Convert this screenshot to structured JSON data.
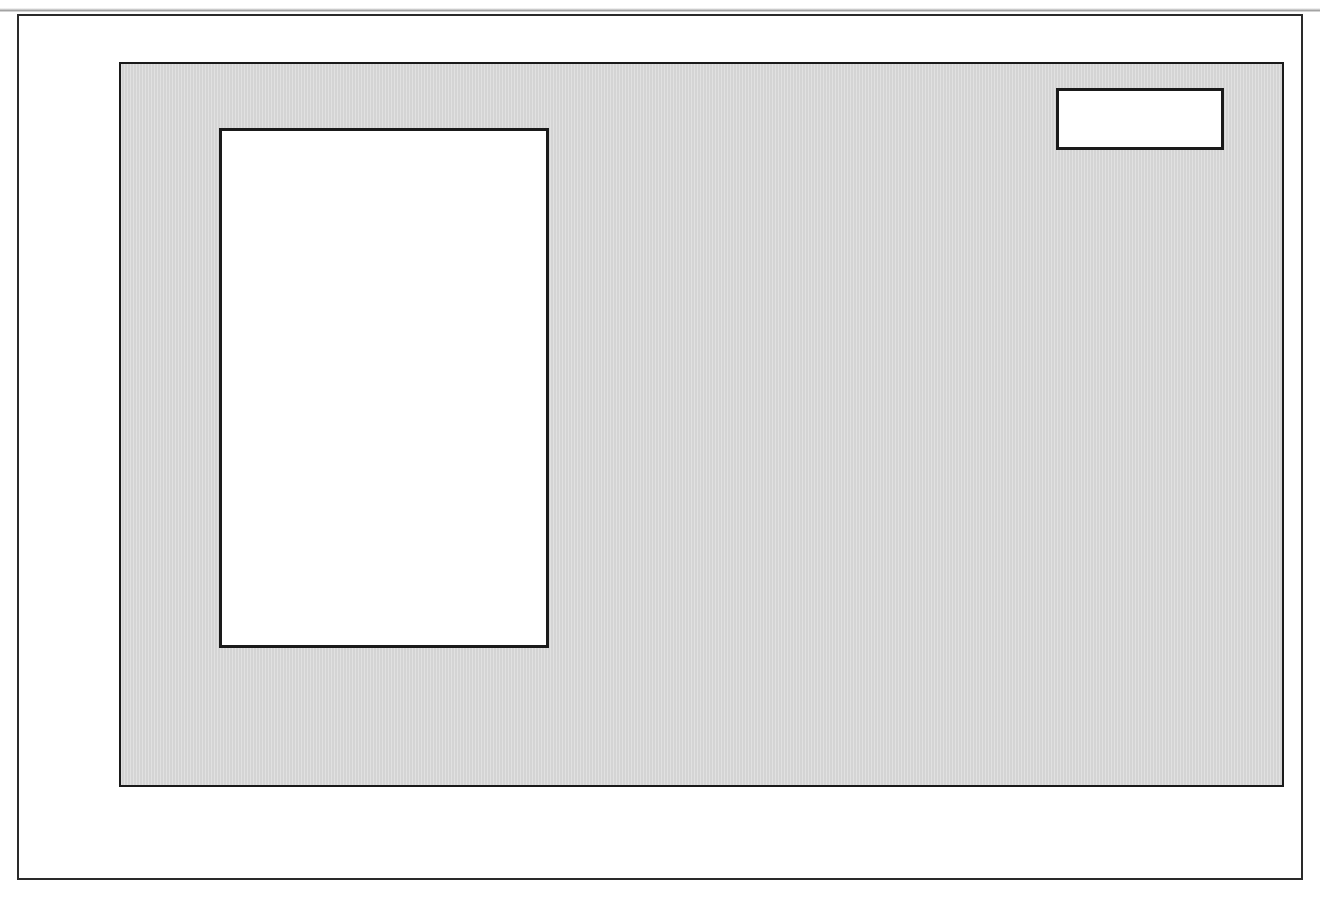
{
  "figure": {
    "scan_artifact_text": "",
    "marker_label": "2010",
    "marker_line_color": "#e8492e",
    "plot_background": "#d4d4d4"
  },
  "axes": {
    "y_title": "Production Gb/a",
    "y_ticks": [
      "1.6",
      "1.2",
      "0.8",
      "0.4",
      "0.0"
    ],
    "x_ticks": [
      "1930",
      "1950",
      "1970",
      "1990",
      "2010",
      "2030"
    ]
  },
  "legend": {
    "items": [
      {
        "label": "Papua-N G",
        "color": "#241a4a"
      },
      {
        "label": "Pakistan",
        "color": "#59608e"
      },
      {
        "label": "Thailand",
        "color": "#d8211a"
      },
      {
        "label": "Brunei",
        "color": "#dde24f"
      },
      {
        "label": "Vietnam",
        "color": "#ffffff"
      },
      {
        "label": "Australia",
        "color": "#cfe3dc"
      },
      {
        "label": "India",
        "color": "#adbacf"
      },
      {
        "label": "Malaysia",
        "color": "#f4a43a"
      },
      {
        "label": "Indonesia",
        "color": "#cfe3c9"
      }
    ]
  },
  "chart_data": {
    "type": "area",
    "stacked": true,
    "title": "",
    "xlabel": "",
    "ylabel": "Production Gb/a",
    "xlim": [
      1930,
      2030
    ],
    "ylim": [
      0.0,
      1.6
    ],
    "y_ticks": [
      0.0,
      0.4,
      0.8,
      1.2,
      1.6
    ],
    "x_ticks": [
      1930,
      1950,
      1970,
      1990,
      2010,
      2030
    ],
    "x_minor_tick_step": 10,
    "grid": "horizontal",
    "legend_position": "upper-left-inside",
    "annotations": [
      {
        "text": "2010",
        "x": 2010,
        "type": "vertical-line-with-box",
        "color": "#e8492e"
      }
    ],
    "x": [
      1930,
      1931,
      1932,
      1933,
      1934,
      1935,
      1936,
      1937,
      1938,
      1939,
      1940,
      1941,
      1942,
      1943,
      1944,
      1945,
      1946,
      1947,
      1948,
      1949,
      1950,
      1951,
      1952,
      1953,
      1954,
      1955,
      1956,
      1957,
      1958,
      1959,
      1960,
      1961,
      1962,
      1963,
      1964,
      1965,
      1966,
      1967,
      1968,
      1969,
      1970,
      1971,
      1972,
      1973,
      1974,
      1975,
      1976,
      1977,
      1978,
      1979,
      1980,
      1981,
      1982,
      1983,
      1984,
      1985,
      1986,
      1987,
      1988,
      1989,
      1990,
      1991,
      1992,
      1993,
      1994,
      1995,
      1996,
      1997,
      1998,
      1999,
      2000,
      2001,
      2002,
      2003,
      2004,
      2005,
      2006,
      2007,
      2008,
      2009,
      2010,
      2011,
      2012,
      2013,
      2014,
      2015,
      2016,
      2017,
      2018,
      2019,
      2020,
      2021,
      2022,
      2023,
      2024,
      2025,
      2026,
      2027,
      2028,
      2029,
      2030
    ],
    "series": [
      {
        "name": "Indonesia",
        "color": "#cfe3c9",
        "values": [
          0.045,
          0.047,
          0.048,
          0.05,
          0.053,
          0.056,
          0.06,
          0.064,
          0.068,
          0.072,
          0.07,
          0.06,
          0.028,
          0.038,
          0.04,
          0.01,
          0.004,
          0.02,
          0.045,
          0.065,
          0.075,
          0.082,
          0.088,
          0.094,
          0.1,
          0.106,
          0.112,
          0.116,
          0.12,
          0.126,
          0.132,
          0.138,
          0.142,
          0.146,
          0.152,
          0.158,
          0.166,
          0.176,
          0.19,
          0.205,
          0.225,
          0.25,
          0.285,
          0.33,
          0.345,
          0.335,
          0.36,
          0.385,
          0.4,
          0.425,
          0.425,
          0.42,
          0.41,
          0.43,
          0.465,
          0.47,
          0.47,
          0.47,
          0.47,
          0.48,
          0.5,
          0.52,
          0.52,
          0.52,
          0.525,
          0.53,
          0.54,
          0.545,
          0.525,
          0.52,
          0.51,
          0.495,
          0.475,
          0.455,
          0.435,
          0.42,
          0.405,
          0.395,
          0.385,
          0.375,
          0.365,
          0.355,
          0.345,
          0.335,
          0.325,
          0.315,
          0.305,
          0.292,
          0.28,
          0.27,
          0.258,
          0.248,
          0.238,
          0.228,
          0.218,
          0.208,
          0.2,
          0.192,
          0.183,
          0.175,
          0.168
        ]
      },
      {
        "name": "Malaysia",
        "color": "#f4a43a",
        "values": [
          0,
          0,
          0,
          0,
          0,
          0,
          0,
          0,
          0,
          0,
          0,
          0,
          0,
          0,
          0,
          0,
          0,
          0,
          0,
          0,
          0,
          0,
          0,
          0,
          0,
          0,
          0,
          0,
          0,
          0,
          0,
          0,
          0,
          0,
          0,
          0,
          0,
          0,
          0,
          0.002,
          0.004,
          0.006,
          0.012,
          0.03,
          0.032,
          0.035,
          0.062,
          0.072,
          0.075,
          0.1,
          0.102,
          0.105,
          0.118,
          0.135,
          0.14,
          0.14,
          0.148,
          0.162,
          0.165,
          0.17,
          0.185,
          0.2,
          0.21,
          0.22,
          0.235,
          0.245,
          0.25,
          0.255,
          0.245,
          0.25,
          0.245,
          0.24,
          0.235,
          0.228,
          0.22,
          0.212,
          0.202,
          0.19,
          0.18,
          0.172,
          0.165,
          0.158,
          0.152,
          0.146,
          0.14,
          0.134,
          0.128,
          0.122,
          0.116,
          0.11,
          0.105,
          0.1,
          0.095,
          0.09,
          0.086,
          0.082,
          0.078,
          0.074,
          0.07,
          0.066,
          0.062
        ]
      },
      {
        "name": "India",
        "color": "#adbacf",
        "values": [
          0,
          0,
          0,
          0,
          0,
          0,
          0,
          0,
          0,
          0,
          0,
          0,
          0,
          0,
          0,
          0,
          0,
          0,
          0,
          0,
          0,
          0,
          0,
          0,
          0,
          0,
          0,
          0,
          0,
          0,
          0.002,
          0.003,
          0.004,
          0.005,
          0.006,
          0.007,
          0.008,
          0.01,
          0.012,
          0.014,
          0.018,
          0.02,
          0.022,
          0.025,
          0.028,
          0.03,
          0.045,
          0.058,
          0.062,
          0.075,
          0.08,
          0.09,
          0.105,
          0.12,
          0.135,
          0.145,
          0.15,
          0.155,
          0.158,
          0.16,
          0.172,
          0.178,
          0.182,
          0.188,
          0.192,
          0.196,
          0.2,
          0.21,
          0.225,
          0.24,
          0.25,
          0.25,
          0.245,
          0.24,
          0.235,
          0.228,
          0.22,
          0.212,
          0.205,
          0.198,
          0.19,
          0.184,
          0.178,
          0.172,
          0.165,
          0.158,
          0.152,
          0.145,
          0.139,
          0.132,
          0.126,
          0.12,
          0.114,
          0.108,
          0.103,
          0.098,
          0.093,
          0.088,
          0.083,
          0.079,
          0.075
        ]
      },
      {
        "name": "Australia",
        "color": "#cfe3dc",
        "values": [
          0,
          0,
          0,
          0,
          0,
          0,
          0,
          0,
          0,
          0,
          0,
          0,
          0,
          0,
          0,
          0,
          0,
          0,
          0,
          0,
          0,
          0,
          0,
          0,
          0,
          0,
          0,
          0,
          0,
          0,
          0,
          0,
          0,
          0,
          0,
          0,
          0,
          0,
          0.004,
          0.008,
          0.012,
          0.03,
          0.06,
          0.095,
          0.12,
          0.13,
          0.15,
          0.155,
          0.15,
          0.155,
          0.145,
          0.14,
          0.145,
          0.15,
          0.16,
          0.17,
          0.18,
          0.185,
          0.19,
          0.2,
          0.215,
          0.235,
          0.25,
          0.255,
          0.25,
          0.245,
          0.25,
          0.265,
          0.255,
          0.25,
          0.245,
          0.235,
          0.228,
          0.22,
          0.21,
          0.202,
          0.195,
          0.188,
          0.18,
          0.172,
          0.165,
          0.158,
          0.152,
          0.145,
          0.139,
          0.133,
          0.127,
          0.121,
          0.115,
          0.11,
          0.105,
          0.1,
          0.095,
          0.09,
          0.086,
          0.082,
          0.078,
          0.074,
          0.07,
          0.066,
          0.063
        ]
      },
      {
        "name": "Vietnam",
        "color": "#ffffff",
        "values": [
          0,
          0,
          0,
          0,
          0,
          0,
          0,
          0,
          0,
          0,
          0,
          0,
          0,
          0,
          0,
          0,
          0,
          0,
          0,
          0,
          0,
          0,
          0,
          0,
          0,
          0,
          0,
          0,
          0,
          0,
          0,
          0,
          0,
          0,
          0,
          0,
          0,
          0,
          0,
          0,
          0,
          0,
          0,
          0,
          0,
          0,
          0,
          0,
          0,
          0,
          0,
          0,
          0,
          0,
          0,
          0.002,
          0.004,
          0.008,
          0.012,
          0.02,
          0.03,
          0.042,
          0.055,
          0.065,
          0.075,
          0.082,
          0.09,
          0.098,
          0.105,
          0.112,
          0.125,
          0.13,
          0.132,
          0.13,
          0.128,
          0.124,
          0.12,
          0.115,
          0.11,
          0.105,
          0.1,
          0.096,
          0.092,
          0.088,
          0.084,
          0.08,
          0.076,
          0.072,
          0.068,
          0.064,
          0.061,
          0.058,
          0.055,
          0.052,
          0.049,
          0.046,
          0.044,
          0.041,
          0.039,
          0.037,
          0.035
        ]
      },
      {
        "name": "Brunei",
        "color": "#dde24f",
        "values": [
          0,
          0,
          0,
          0,
          0,
          0,
          0,
          0,
          0,
          0,
          0,
          0,
          0,
          0,
          0,
          0,
          0.002,
          0.006,
          0.01,
          0.014,
          0.016,
          0.018,
          0.02,
          0.021,
          0.022,
          0.023,
          0.024,
          0.025,
          0.026,
          0.027,
          0.028,
          0.029,
          0.03,
          0.031,
          0.032,
          0.033,
          0.035,
          0.038,
          0.042,
          0.046,
          0.05,
          0.055,
          0.062,
          0.07,
          0.075,
          0.072,
          0.078,
          0.082,
          0.08,
          0.085,
          0.082,
          0.075,
          0.068,
          0.065,
          0.068,
          0.07,
          0.07,
          0.072,
          0.072,
          0.074,
          0.078,
          0.08,
          0.082,
          0.082,
          0.08,
          0.078,
          0.08,
          0.082,
          0.08,
          0.078,
          0.078,
          0.076,
          0.074,
          0.072,
          0.07,
          0.068,
          0.065,
          0.062,
          0.06,
          0.057,
          0.055,
          0.053,
          0.05,
          0.048,
          0.046,
          0.044,
          0.042,
          0.04,
          0.038,
          0.036,
          0.034,
          0.032,
          0.031,
          0.029,
          0.028,
          0.026,
          0.025,
          0.024,
          0.022,
          0.021,
          0.02
        ]
      },
      {
        "name": "Thailand",
        "color": "#d8211a",
        "values": [
          0,
          0,
          0,
          0,
          0,
          0,
          0,
          0,
          0,
          0,
          0,
          0,
          0,
          0,
          0,
          0,
          0,
          0,
          0,
          0,
          0,
          0,
          0,
          0,
          0,
          0,
          0,
          0,
          0,
          0,
          0,
          0,
          0,
          0,
          0,
          0,
          0,
          0,
          0,
          0,
          0,
          0,
          0,
          0,
          0,
          0,
          0,
          0,
          0,
          0,
          0,
          0,
          0.002,
          0.004,
          0.006,
          0.008,
          0.01,
          0.012,
          0.014,
          0.018,
          0.022,
          0.026,
          0.03,
          0.034,
          0.038,
          0.042,
          0.046,
          0.05,
          0.052,
          0.056,
          0.06,
          0.062,
          0.064,
          0.066,
          0.068,
          0.07,
          0.072,
          0.074,
          0.075,
          0.076,
          0.076,
          0.074,
          0.072,
          0.07,
          0.068,
          0.065,
          0.062,
          0.059,
          0.056,
          0.053,
          0.05,
          0.047,
          0.045,
          0.042,
          0.04,
          0.038,
          0.036,
          0.034,
          0.032,
          0.03,
          0.029
        ]
      },
      {
        "name": "Pakistan",
        "color": "#59608e",
        "values": [
          0,
          0,
          0,
          0,
          0,
          0,
          0,
          0,
          0,
          0,
          0,
          0,
          0,
          0,
          0,
          0,
          0,
          0,
          0,
          0,
          0,
          0,
          0,
          0,
          0,
          0,
          0,
          0,
          0,
          0,
          0,
          0,
          0,
          0,
          0,
          0,
          0,
          0,
          0,
          0,
          0.001,
          0.001,
          0.002,
          0.002,
          0.003,
          0.003,
          0.004,
          0.004,
          0.005,
          0.006,
          0.007,
          0.008,
          0.009,
          0.01,
          0.011,
          0.012,
          0.013,
          0.014,
          0.015,
          0.016,
          0.018,
          0.019,
          0.02,
          0.021,
          0.022,
          0.023,
          0.024,
          0.025,
          0.025,
          0.026,
          0.026,
          0.026,
          0.025,
          0.025,
          0.024,
          0.023,
          0.023,
          0.022,
          0.021,
          0.021,
          0.02,
          0.019,
          0.019,
          0.018,
          0.017,
          0.017,
          0.016,
          0.015,
          0.015,
          0.014,
          0.013,
          0.013,
          0.012,
          0.012,
          0.011,
          0.01,
          0.01,
          0.009,
          0.009,
          0.008,
          0.008
        ]
      },
      {
        "name": "Papua-N G",
        "color": "#241a4a",
        "values": [
          0,
          0,
          0,
          0,
          0,
          0,
          0,
          0,
          0,
          0,
          0,
          0,
          0,
          0,
          0,
          0,
          0,
          0,
          0,
          0,
          0,
          0,
          0,
          0,
          0,
          0,
          0,
          0,
          0,
          0,
          0,
          0,
          0,
          0,
          0,
          0,
          0,
          0,
          0,
          0,
          0,
          0,
          0,
          0,
          0,
          0,
          0,
          0,
          0,
          0,
          0,
          0,
          0,
          0,
          0,
          0,
          0,
          0,
          0,
          0,
          0,
          0.01,
          0.025,
          0.032,
          0.035,
          0.036,
          0.038,
          0.04,
          0.036,
          0.032,
          0.03,
          0.028,
          0.026,
          0.024,
          0.022,
          0.021,
          0.019,
          0.018,
          0.017,
          0.016,
          0.015,
          0.014,
          0.014,
          0.013,
          0.012,
          0.012,
          0.011,
          0.01,
          0.01,
          0.009,
          0.009,
          0.008,
          0.008,
          0.007,
          0.007,
          0.006,
          0.006,
          0.006,
          0.005,
          0.005,
          0.005
        ]
      }
    ]
  }
}
